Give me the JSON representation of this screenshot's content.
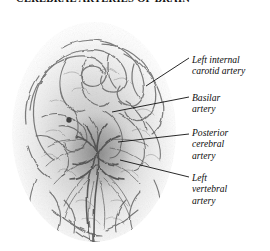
{
  "figure": {
    "caption": "CEREBRAL ARTERIES OF BRAIN",
    "image_alt": "cerebral-angiogram",
    "modality": "angiogram",
    "view": "anterior-posterior",
    "background_color": "#ffffff",
    "ink_color": "#4a4a4a"
  },
  "labels": {
    "carotid": {
      "name": "left-internal-carotid-artery",
      "line1": "Left internal",
      "line2": "carotid artery"
    },
    "basilar": {
      "name": "basilar-artery",
      "line1": "Basilar",
      "line2": "artery"
    },
    "posterior": {
      "name": "posterior-cerebral-artery",
      "line1": "Posterior",
      "line2": "cerebral",
      "line3": "artery"
    },
    "vertebral": {
      "name": "left-vertebral-artery",
      "line1": "Left",
      "line2": "vertebral",
      "line3": "artery"
    }
  }
}
